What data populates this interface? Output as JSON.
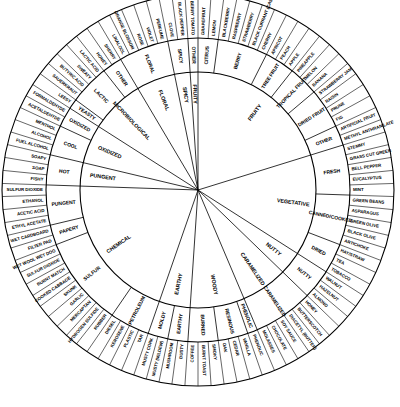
{
  "diagram": {
    "kind": "wine-aroma-wheel",
    "ring_count": 3,
    "center_x": 198,
    "center_y": 190,
    "radii": {
      "inner_start": 8,
      "inner_end": 118,
      "mid_end": 152,
      "outer_end": 196
    },
    "colors": {
      "background": "#ffffff",
      "stroke": "#000000",
      "text": "#000000"
    },
    "start_angle_deg": -90,
    "segments": [
      {
        "inner": "FRUITY",
        "mid": "CITRUS",
        "outer": [
          "GRAPEFRUIT",
          "LEMON"
        ]
      },
      {
        "inner": "FRUITY",
        "mid": "BERRY",
        "outer": [
          "BLACKBERRY",
          "RASPBERRY",
          "STRAWBERRY",
          "BLACK CURRANT (CASSIS)",
          "CHERRY"
        ]
      },
      {
        "inner": "FRUITY",
        "mid": "TREE FRUIT",
        "outer": [
          "APRICOT",
          "PEACH",
          "APPLE"
        ]
      },
      {
        "inner": "FRUITY",
        "mid": "TROPICAL FRUIT",
        "outer": [
          "PINEAPPLE",
          "MELON",
          "BANANA"
        ]
      },
      {
        "inner": "FRUITY",
        "mid": "DRIED FRUIT",
        "outer": [
          "STRAWBERRY JAM",
          "RAISIN",
          "PRUNE",
          "FIG"
        ]
      },
      {
        "inner": "FRUITY",
        "mid": "OTHER",
        "outer": [
          "ARTIFICIAL FRUIT",
          "METHYL ANTHRANILATE"
        ]
      },
      {
        "inner": "VEGETATIVE",
        "mid": "FRESH",
        "outer": [
          "STEMMY",
          "GRASS CUT GREEN",
          "BELL PEPPER",
          "EUCALYPTUS",
          "MINT"
        ]
      },
      {
        "inner": "VEGETATIVE",
        "mid": "CANNED/COOKED",
        "outer": [
          "GREEN BEANS",
          "ASPARAGUS",
          "GREEN OLIVE",
          "BLACK OLIVE",
          "ARTICHOKE"
        ]
      },
      {
        "inner": "VEGETATIVE",
        "mid": "DRIED",
        "outer": [
          "HAY/STRAW",
          "TEA",
          "TOBACCO"
        ]
      },
      {
        "inner": "NUTTY",
        "mid": "NUTTY",
        "outer": [
          "WALNUT",
          "HAZELNUT",
          "ALMOND"
        ]
      },
      {
        "inner": "CARAMELIZED",
        "mid": "CARAMELIZED",
        "outer": [
          "HONEY",
          "BUTTERSCOTCH",
          "DIACETYL (BUTTER)",
          "SOY SAUCE",
          "CHOCOLATE",
          "MOLASSES"
        ]
      },
      {
        "inner": "WOODY",
        "mid": "PHENOLIC",
        "outer": [
          "PHENOLIC"
        ]
      },
      {
        "inner": "WOODY",
        "mid": "RESINOUS",
        "outer": [
          "VANILLA",
          "CEDAR",
          "OAK"
        ]
      },
      {
        "inner": "WOODY",
        "mid": "BURNED",
        "outer": [
          "SMOKY",
          "BURNT TOAST",
          "COFFEE"
        ]
      },
      {
        "inner": "EARTHY",
        "mid": "EARTHY",
        "outer": [
          "DUSTY",
          "MUSHROOM"
        ]
      },
      {
        "inner": "EARTHY",
        "mid": "MOLDY",
        "outer": [
          "MUSTY (MILDEW)",
          "MUSTY CORK"
        ]
      },
      {
        "inner": "CHEMICAL",
        "mid": "PETROLEUM",
        "outer": [
          "TAR",
          "PLASTIC",
          "KEROSENE",
          "DIESEL"
        ]
      },
      {
        "inner": "CHEMICAL",
        "mid": "SULFUR",
        "outer": [
          "RUBBER",
          "HYDROGEN SULFIDE",
          "MERCAPTAN",
          "GARLIC",
          "SKUNK",
          "COOKED CABBAGE",
          "BURNT MATCH",
          "SULFUR DIOXIDE",
          "WET WOOL WET DOG"
        ]
      },
      {
        "inner": "CHEMICAL",
        "mid": "PAPERY",
        "outer": [
          "FILTER PAD",
          "WET CARDBOARD"
        ]
      },
      {
        "inner": "CHEMICAL",
        "mid": "PUNGENT",
        "outer": [
          "ETHYL ACETATE",
          "ACETIC ACID",
          "ETHANOL",
          "SULFUR DIOXIDE"
        ]
      },
      {
        "inner": "PUNGENT",
        "mid": "HOT",
        "outer": [
          "FISHY",
          "SOAP",
          "SOAPY"
        ]
      },
      {
        "inner": "OXIDIZED",
        "mid": "COOL",
        "outer": [
          "FUEL ALCOHOL",
          "ALCOHOL",
          "MENTHOL"
        ]
      },
      {
        "inner": "OXIDIZED",
        "mid": "OXIDIZED",
        "outer": [
          "ACETALDEHYDE",
          "FORMALDEHYDE"
        ]
      },
      {
        "inner": "MICROBIOLOGICAL",
        "mid": "YEASTY",
        "outer": [
          "LEESY"
        ]
      },
      {
        "inner": "MICROBIOLOGICAL",
        "mid": "LACTIC",
        "outer": [
          "SAUERKRAUT",
          "BUTYRIC ACID",
          "SWEATY",
          "LACTIC ACID"
        ]
      },
      {
        "inner": "MICROBIOLOGICAL",
        "mid": "OTHER",
        "outer": [
          "HONEY",
          "SHERRY"
        ]
      },
      {
        "inner": "FLORAL",
        "mid": "FLORAL",
        "outer": [
          "LINALOOL",
          "ORANGE BLOSSOM",
          "ROSE",
          "VIOLET",
          "PERFUME"
        ]
      },
      {
        "inner": "SPICY",
        "mid": "SPICY",
        "outer": [
          "CLOVE",
          "BLACK PEPPER"
        ]
      },
      {
        "inner": "FRUITY",
        "mid": "OTHER",
        "outer": [
          "BERRY TOMATO"
        ]
      }
    ],
    "inner_ring_labels": [
      "FRUITY",
      "VEGETATIVE",
      "NUTTY",
      "CARAMELIZED",
      "WOODY",
      "EARTHY",
      "CHEMICAL",
      "PUNGENT",
      "OXIDIZED",
      "MICROBIOLOGICAL",
      "FLORAL",
      "SPICY"
    ],
    "mid_ring_labels": [
      "CITRUS",
      "BERRY",
      "TREE FRUIT",
      "TROPICAL FRUIT",
      "DRIED FRUIT",
      "OTHER",
      "FRESH",
      "CANNED/COOKED",
      "DRIED",
      "NUTTY",
      "CARAMELIZED",
      "PHENOLIC",
      "RESINOUS",
      "BURNED",
      "EARTHY",
      "MOLDY",
      "PETROLEUM",
      "SULFUR",
      "PAPERY",
      "PUNGENT",
      "HOT",
      "COOL",
      "OXIDIZED",
      "YEASTY",
      "LACTIC",
      "OTHER",
      "FLORAL",
      "SPICY",
      "OTHER"
    ],
    "outer_ring_labels": [
      "GRAPEFRUIT",
      "LEMON",
      "BLACKBERRY",
      "RASPBERRY",
      "STRAWBERRY",
      "BLACK CURRANT (CASSIS)",
      "CHERRY",
      "APRICOT",
      "PEACH",
      "APPLE",
      "PINEAPPLE",
      "MELON",
      "BANANA",
      "STRAWBERRY JAM",
      "RAISIN",
      "PRUNE",
      "FIG",
      "ARTIFICIAL FRUIT",
      "METHYL ANTHRANILATE",
      "STEMMY",
      "GRASS CUT GREEN",
      "BELL PEPPER",
      "EUCALYPTUS",
      "MINT",
      "GREEN BEANS",
      "ASPARAGUS",
      "GREEN OLIVE",
      "BLACK OLIVE",
      "ARTICHOKE",
      "HAY/STRAW",
      "TEA",
      "TOBACCO",
      "WALNUT",
      "HAZELNUT",
      "ALMOND",
      "HONEY",
      "BUTTERSCOTCH",
      "DIACETYL (BUTTER)",
      "SOY SAUCE",
      "CHOCOLATE",
      "MOLASSES",
      "PHENOLIC",
      "VANILLA",
      "CEDAR",
      "OAK",
      "SMOKY",
      "BURNT TOAST",
      "COFFEE",
      "DUSTY",
      "MUSHROOM",
      "MUSTY (MILDEW)",
      "MUSTY CORK",
      "TAR",
      "PLASTIC",
      "KEROSENE",
      "DIESEL",
      "RUBBER",
      "HYDROGEN SULFIDE",
      "MERCAPTAN",
      "GARLIC",
      "SKUNK",
      "COOKED CABBAGE",
      "BURNT MATCH",
      "SULFUR DIOXIDE",
      "WET WOOL WET DOG",
      "FILTER PAD",
      "WET CARDBOARD",
      "ETHYL ACETATE",
      "ACETIC ACID",
      "ETHANOL",
      "SULFUR DIOXIDE",
      "FISHY",
      "SOAP",
      "SOAPY",
      "FUEL ALCOHOL",
      "ALCOHOL",
      "MENTHOL",
      "ACETALDEHYDE",
      "FORMALDEHYDE",
      "LEESY",
      "SAUERKRAUT",
      "BUTYRIC ACID",
      "SWEATY",
      "LACTIC ACID",
      "HONEY",
      "SHERRY",
      "LINALOOL",
      "ORANGE BLOSSOM",
      "ROSE",
      "VIOLET",
      "PERFUME",
      "CLOVE",
      "BLACK PEPPER",
      "BERRY TOMATO"
    ]
  }
}
